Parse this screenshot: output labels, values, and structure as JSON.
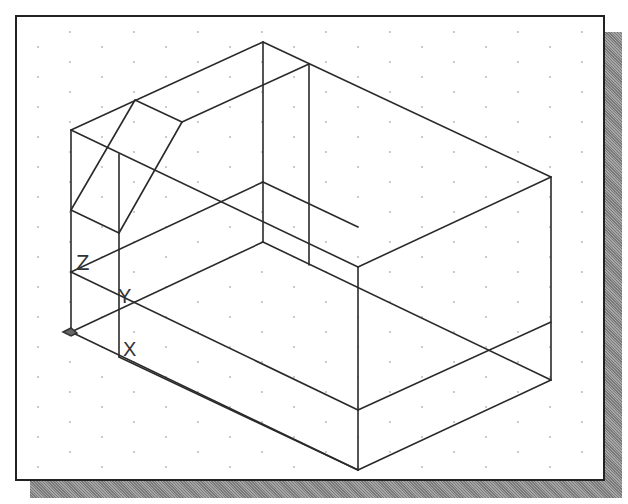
{
  "viewport": {
    "name": "CAD isometric drawing viewport",
    "grid": {
      "style": "isometric-dots",
      "spacing_x": 32,
      "spacing_y": 30,
      "dot_color": "#888888"
    },
    "line_color": "#2a2a2a",
    "border_color": "#222222",
    "shadow_color": "#8a8a8a"
  },
  "ucs_icon": {
    "labels": {
      "x": "X",
      "y": "Y",
      "z": "Z"
    }
  },
  "wireframe": {
    "edges": [
      [
        69,
        128,
        261,
        40
      ],
      [
        261,
        40,
        549,
        175
      ],
      [
        69,
        128,
        356,
        265
      ],
      [
        356,
        265,
        549,
        175
      ],
      [
        133,
        98,
        180,
        120
      ],
      [
        180,
        120,
        307,
        62
      ],
      [
        69,
        128,
        69,
        330
      ],
      [
        117,
        152,
        117,
        355
      ],
      [
        133,
        98,
        69,
        208
      ],
      [
        180,
        120,
        117,
        231
      ],
      [
        69,
        208,
        117,
        231
      ],
      [
        261,
        40,
        261,
        240
      ],
      [
        307,
        62,
        307,
        263
      ],
      [
        69,
        270,
        261,
        180
      ],
      [
        261,
        180,
        356,
        225
      ],
      [
        69,
        330,
        356,
        468
      ],
      [
        117,
        355,
        356,
        468
      ],
      [
        356,
        265,
        356,
        468
      ],
      [
        549,
        175,
        549,
        378
      ],
      [
        356,
        468,
        549,
        378
      ],
      [
        356,
        408,
        549,
        320
      ],
      [
        69,
        270,
        356,
        408
      ],
      [
        261,
        240,
        549,
        378
      ],
      [
        69,
        330,
        261,
        240
      ]
    ]
  }
}
